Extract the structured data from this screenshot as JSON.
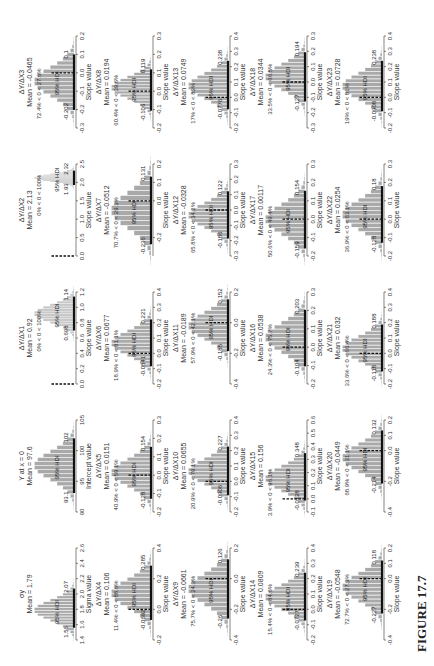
{
  "figure": {
    "label": "FIGURE 17.7",
    "orientation": "rotated 90 degrees counter-clockwise"
  },
  "chart_data": [
    {
      "type": "histogram",
      "title": "σy",
      "mean_label": "Mean = 1.79",
      "mean": 1.79,
      "hdi": [
        1.56,
        2.07
      ],
      "hdi_label": "95% HDI",
      "xlabel": "Sigma value",
      "ticks": [
        "1.4",
        "1.6",
        "1.8",
        "2.0",
        "2.2",
        "2.4",
        "2.6"
      ],
      "xlim": [
        1.4,
        2.6
      ],
      "pct_label": ""
    },
    {
      "type": "histogram",
      "title": "Y at x = 0",
      "mean_label": "Mean = 97.6",
      "mean": 97.6,
      "hdi": [
        93.1,
        102
      ],
      "hdi_label": "95% HDI",
      "xlabel": "Intercept value",
      "ticks": [
        "90",
        "95",
        "100",
        "105"
      ],
      "xlim": [
        90,
        105
      ],
      "pct_label": ""
    },
    {
      "type": "histogram",
      "title": "ΔY/ΔX1",
      "mean_label": "Mean = 0.92",
      "mean": 0.92,
      "hdi": [
        0.698,
        1.14
      ],
      "hdi_label": "95% HDI",
      "xlabel": "Slope value",
      "ticks": [
        "0.0",
        "0.2",
        "0.4",
        "0.6",
        "0.8",
        "1.0",
        "1.2"
      ],
      "xlim": [
        0,
        1.2
      ],
      "pct_label": "0% < 0 < 100%"
    },
    {
      "type": "histogram",
      "title": "ΔY/ΔX2",
      "mean_label": "Mean = 2.13",
      "mean": 2.13,
      "hdi": [
        1.93,
        2.32
      ],
      "hdi_label": "95% HDI",
      "xlabel": "Slope value",
      "ticks": [
        "0.0",
        "0.5",
        "1.0",
        "1.5",
        "2.0",
        "2.5"
      ],
      "xlim": [
        0,
        2.5
      ],
      "pct_label": "0% < 0 < 100%"
    },
    {
      "type": "histogram",
      "title": "ΔY/ΔX3",
      "mean_label": "Mean = -0.0465",
      "mean": -0.0465,
      "hdi": [
        -0.202,
        0.1
      ],
      "hdi_label": "95% HDI",
      "xlabel": "Slope value",
      "ticks": [
        "-0.3",
        "-0.2",
        "-0.1",
        "0.0",
        "0.1",
        "0.2"
      ],
      "xlim": [
        -0.3,
        0.2
      ],
      "pct_label": "72.4% < 0 < 27.6%"
    },
    {
      "type": "histogram",
      "title": "ΔY/ΔX4",
      "mean_label": "Mean = 0.106",
      "mean": 0.106,
      "hdi": [
        -0.0692,
        0.285
      ],
      "hdi_label": "95% HDI",
      "xlabel": "Slope value",
      "ticks": [
        "-0.2",
        "0.0",
        "0.2",
        "0.4"
      ],
      "xlim": [
        -0.2,
        0.4
      ],
      "pct_label": "11.4% < 0 < 88.6%"
    },
    {
      "type": "histogram",
      "title": "ΔY/ΔX5",
      "mean_label": "Mean = 0.0151",
      "mean": 0.0151,
      "hdi": [
        -0.128,
        0.154
      ],
      "hdi_label": "95% HDI",
      "xlabel": "Slope value",
      "ticks": [
        "-0.2",
        "-0.1",
        "0.0",
        "0.1",
        "0.2",
        "0.3"
      ],
      "xlim": [
        -0.2,
        0.3
      ],
      "pct_label": "40.9% < 0 < 59.1%"
    },
    {
      "type": "histogram",
      "title": "ΔY/ΔX6",
      "mean_label": "Mean = 0.0677",
      "mean": 0.0677,
      "hdi": [
        -0.0841,
        0.221
      ],
      "hdi_label": "95% HDI",
      "xlabel": "Slope value",
      "ticks": [
        "-0.2",
        "-0.1",
        "0.0",
        "0.1",
        "0.2",
        "0.3",
        "0.4"
      ],
      "xlim": [
        -0.2,
        0.4
      ],
      "pct_label": "18.9% < 0 < 81.1%"
    },
    {
      "type": "histogram",
      "title": "ΔY/ΔX7",
      "mean_label": "Mean = -0.0512",
      "mean": -0.0512,
      "hdi": [
        -0.236,
        0.131
      ],
      "hdi_label": "95% HDI",
      "xlabel": "Slope value",
      "ticks": [
        "-0.2",
        "0.0",
        "0.1",
        "0.2"
      ],
      "xlim": [
        -0.3,
        0.2
      ],
      "pct_label": "70.7% < 0 < 29.3%"
    },
    {
      "type": "histogram",
      "title": "ΔY/ΔX8",
      "mean_label": "Mean = 0.0194",
      "mean": 0.0194,
      "hdi": [
        -0.106,
        0.119
      ],
      "hdi_label": "95% HDI",
      "xlabel": "Slope value",
      "ticks": [
        "-0.2",
        "-0.1",
        "0.0",
        "0.1",
        "0.2",
        "0.3"
      ],
      "xlim": [
        -0.2,
        0.3
      ],
      "pct_label": "60.4% < 0 < 39.6%"
    },
    {
      "type": "histogram",
      "title": "ΔY/ΔX9",
      "mean_label": "Mean = -0.0661",
      "mean": -0.0661,
      "hdi": [
        -0.26,
        0.126
      ],
      "hdi_label": "95% HDI",
      "xlabel": "Slope value",
      "ticks": [
        "-0.4",
        "-0.2",
        "0.0",
        "0.2"
      ],
      "xlim": [
        -0.4,
        0.2
      ],
      "pct_label": "75.7% < 0 < 24.3%"
    },
    {
      "type": "histogram",
      "title": "ΔY/ΔX10",
      "mean_label": "Mean = 0.0655",
      "mean": 0.0655,
      "hdi": [
        -0.0906,
        0.227
      ],
      "hdi_label": "95% HDI",
      "xlabel": "Slope value",
      "ticks": [
        "-0.2",
        "-0.1",
        "0.0",
        "0.1",
        "0.2",
        "0.3",
        "0.4"
      ],
      "xlim": [
        -0.2,
        0.4
      ],
      "pct_label": "20.9% < 0 < 79.1%"
    },
    {
      "type": "histogram",
      "title": "ΔY/ΔX11",
      "mean_label": "Mean = -0.0189",
      "mean": -0.0189,
      "hdi": [
        -0.185,
        0.152
      ],
      "hdi_label": "95% HDI",
      "xlabel": "Slope value",
      "ticks": [
        "-0.4",
        "-0.2",
        "0.0",
        "0.2"
      ],
      "xlim": [
        -0.4,
        0.2
      ],
      "pct_label": "57.9% < 0 < 42.1%"
    },
    {
      "type": "histogram",
      "title": "ΔY/ΔX12",
      "mean_label": "Mean = -0.0328",
      "mean": -0.0328,
      "hdi": [
        -0.186,
        0.122
      ],
      "hdi_label": "95% HDI",
      "xlabel": "Slope value",
      "ticks": [
        "-0.3",
        "-0.2",
        "-0.1",
        "0.0",
        "0.1",
        "0.2",
        "0.3"
      ],
      "xlim": [
        -0.3,
        0.3
      ],
      "pct_label": "65.8% < 0 < 34.2%"
    },
    {
      "type": "histogram",
      "title": "ΔY/ΔX13",
      "mean_label": "Mean = 0.0749",
      "mean": 0.0749,
      "hdi": [
        -0.0776,
        0.238
      ],
      "hdi_label": "95% HDI",
      "xlabel": "Slope value",
      "ticks": [
        "-0.2",
        "-0.1",
        "0.0",
        "0.1",
        "0.2",
        "0.3",
        "0.4"
      ],
      "xlim": [
        -0.2,
        0.4
      ],
      "pct_label": "17% < 0 < 83%"
    },
    {
      "type": "histogram",
      "title": "ΔY/ΔX14",
      "mean_label": "Mean = 0.0809",
      "mean": 0.0809,
      "hdi": [
        -0.0727,
        0.239
      ],
      "hdi_label": "95% HDI",
      "xlabel": "Slope value",
      "ticks": [
        "-0.2",
        "-0.1",
        "0.0",
        "0.1",
        "0.2",
        "0.3",
        "0.4"
      ],
      "xlim": [
        -0.2,
        0.4
      ],
      "pct_label": "15.4% < 0 < 84.6%"
    },
    {
      "type": "histogram",
      "title": "ΔY/ΔX15",
      "mean_label": "Mean = 0.156",
      "mean": 0.156,
      "hdi": [
        -0.0128,
        0.348
      ],
      "hdi_label": "95% HDI",
      "xlabel": "Slope value",
      "ticks": [
        "-0.1",
        "0.0",
        "0.1",
        "0.2",
        "0.3",
        "0.4",
        "0.5",
        "0.6"
      ],
      "xlim": [
        -0.1,
        0.6
      ],
      "pct_label": "3.9% < 0 < 96.1%"
    },
    {
      "type": "histogram",
      "title": "ΔY/ΔX16",
      "mean_label": "Mean = 0.0538",
      "mean": 0.0538,
      "hdi": [
        -0.104,
        0.203
      ],
      "hdi_label": "95% HDI",
      "xlabel": "Slope value",
      "ticks": [
        "-0.2",
        "-0.1",
        "0.0",
        "0.1",
        "0.2",
        "0.3"
      ],
      "xlim": [
        -0.2,
        0.3
      ],
      "pct_label": "24.3% < 0 < 75.7%"
    },
    {
      "type": "histogram",
      "title": "ΔY/ΔX17",
      "mean_label": "Mean = 0.00117",
      "mean": 0.00117,
      "hdi": [
        -0.159,
        0.154
      ],
      "hdi_label": "95% HDI",
      "xlabel": "Slope value",
      "ticks": [
        "-0.2",
        "-0.1",
        "0.0",
        "0.1",
        "0.2",
        "0.3"
      ],
      "xlim": [
        -0.2,
        0.3
      ],
      "pct_label": "50.6% < 0 < 49.4%"
    },
    {
      "type": "histogram",
      "title": "ΔY/ΔX18",
      "mean_label": "Mean = 0.0344",
      "mean": 0.0344,
      "hdi": [
        -0.127,
        0.194
      ],
      "hdi_label": "95% HDI",
      "xlabel": "Slope value",
      "ticks": [
        "-0.3",
        "-0.2",
        "-0.1",
        "0.0",
        "0.1",
        "0.2",
        "0.3"
      ],
      "xlim": [
        -0.3,
        0.3
      ],
      "pct_label": "33.5% < 0 < 66.5%"
    },
    {
      "type": "histogram",
      "title": "ΔY/ΔX19",
      "mean_label": "Mean = -0.0548",
      "mean": -0.0548,
      "hdi": [
        -0.227,
        0.118
      ],
      "hdi_label": "95% HDI",
      "xlabel": "Slope value",
      "ticks": [
        "-0.4",
        "-0.2",
        "0.0",
        "0.1",
        "0.2"
      ],
      "xlim": [
        -0.4,
        0.2
      ],
      "pct_label": "72.7% < 0 < 27.3%"
    },
    {
      "type": "histogram",
      "title": "ΔY/ΔX20",
      "mean_label": "Mean = -0.0449",
      "mean": -0.0449,
      "hdi": [
        -0.214,
        0.132
      ],
      "hdi_label": "95% HDI",
      "xlabel": "Slope value",
      "ticks": [
        "-0.4",
        "-0.2",
        "0.0",
        "0.1",
        "0.2"
      ],
      "xlim": [
        -0.4,
        0.2
      ],
      "pct_label": "68.9% < 0 < 31.1%"
    },
    {
      "type": "histogram",
      "title": "ΔY/ΔX21",
      "mean_label": "Mean = 0.032",
      "mean": 0.032,
      "hdi": [
        -0.118,
        0.188
      ],
      "hdi_label": "95% HDI",
      "xlabel": "Slope value",
      "ticks": [
        "-0.2",
        "-0.1",
        "0.0",
        "0.1",
        "0.2",
        "0.3",
        "0.4"
      ],
      "xlim": [
        -0.2,
        0.4
      ],
      "pct_label": "33.6% < 0 < 66.4%"
    },
    {
      "type": "histogram",
      "title": "ΔY/ΔX22",
      "mean_label": "Mean = 0.0254",
      "mean": 0.0254,
      "hdi": [
        -0.128,
        0.18
      ],
      "hdi_label": "95% HDI",
      "xlabel": "Slope value",
      "ticks": [
        "-0.2",
        "-0.1",
        "0.0",
        "0.1",
        "0.2",
        "0.3"
      ],
      "xlim": [
        -0.2,
        0.3
      ],
      "pct_label": "36.9% < 0 < 63.1%"
    },
    {
      "type": "histogram",
      "title": "ΔY/ΔX23",
      "mean_label": "Mean = 0.0728",
      "mean": 0.0728,
      "hdi": [
        -0.0908,
        0.238
      ],
      "hdi_label": "95% HDI",
      "xlabel": "Slope value",
      "ticks": [
        "-0.2",
        "-0.1",
        "0.0",
        "0.1",
        "0.2",
        "0.3",
        "0.4"
      ],
      "xlim": [
        -0.2,
        0.4
      ],
      "pct_label": "19% < 0 < 81%"
    }
  ]
}
